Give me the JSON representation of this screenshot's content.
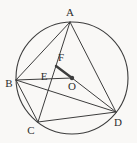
{
  "figure": {
    "background_color": "#f9f8f6",
    "stroke_color": "#3d3d3d",
    "label_color": "#2e2e2e",
    "label_font_size": 11,
    "width": 137,
    "height": 143,
    "circle": {
      "cx": 72,
      "cy": 78,
      "r": 56,
      "stroke_width": 1.1
    },
    "points": {
      "A": {
        "x": 70,
        "y": 22,
        "label": "A",
        "lx": 70,
        "ly": 16
      },
      "B": {
        "x": 16,
        "y": 80,
        "label": "B",
        "lx": 9,
        "ly": 87
      },
      "C": {
        "x": 38,
        "y": 122,
        "label": "C",
        "lx": 31,
        "ly": 134
      },
      "D": {
        "x": 116,
        "y": 112,
        "label": "D",
        "lx": 118,
        "ly": 126
      },
      "O": {
        "x": 72,
        "y": 78,
        "label": "O",
        "lx": 72,
        "ly": 90
      },
      "E": {
        "x": 52,
        "y": 78,
        "label": "E",
        "lx": 44,
        "ly": 80
      },
      "F": {
        "x": 56,
        "y": 66,
        "label": "F",
        "lx": 61,
        "ly": 61
      }
    },
    "segments": [
      {
        "from": "A",
        "to": "B",
        "width": 1
      },
      {
        "from": "A",
        "to": "C",
        "width": 1
      },
      {
        "from": "A",
        "to": "D",
        "width": 1
      },
      {
        "from": "B",
        "to": "C",
        "width": 1
      },
      {
        "from": "B",
        "to": "D",
        "width": 1
      },
      {
        "from": "C",
        "to": "D",
        "width": 1
      },
      {
        "from": "B",
        "to": "O",
        "width": 1
      },
      {
        "from": "O",
        "to": "D",
        "width": 1
      },
      {
        "from": "F",
        "to": "O",
        "width": 2.4
      }
    ],
    "center_dot": {
      "at": "O",
      "radius": 2.2
    }
  }
}
